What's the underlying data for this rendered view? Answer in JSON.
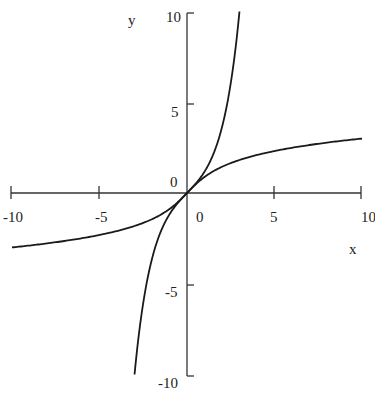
{
  "chart_data": {
    "type": "line",
    "title": "",
    "xlabel": "x",
    "ylabel": "y",
    "xlim": [
      -10,
      10
    ],
    "ylim": [
      -10,
      10
    ],
    "grid": false,
    "legend": null,
    "x_ticks": [
      -10,
      -5,
      0,
      5,
      10
    ],
    "y_ticks": [
      -10,
      -5,
      0,
      5,
      10
    ],
    "x_tick_labels": [
      "-10",
      "-5",
      "0",
      "5",
      "10"
    ],
    "y_tick_labels": [
      "-10",
      "-5",
      "0",
      "5",
      "10"
    ],
    "series": [
      {
        "name": "y = sinh(x)",
        "x": [
          -3.0,
          -2.5,
          -2,
          -1.5,
          -1,
          -0.5,
          0,
          0.5,
          1,
          1.5,
          2,
          2.5,
          3.0
        ],
        "values": [
          -10.02,
          -6.05,
          -3.63,
          -2.13,
          -1.18,
          -0.52,
          0,
          0.52,
          1.18,
          2.13,
          3.63,
          6.05,
          10.02
        ]
      },
      {
        "name": "y = arcsinh(x)",
        "x": [
          -10,
          -8,
          -6,
          -4,
          -2,
          -1,
          0,
          1,
          2,
          4,
          6,
          8,
          10
        ],
        "values": [
          -3.0,
          -2.78,
          -2.49,
          -2.09,
          -1.44,
          -0.88,
          0,
          0.88,
          1.44,
          2.09,
          2.49,
          2.78,
          3.0
        ]
      }
    ]
  },
  "labels": {
    "x_axis": "x",
    "y_axis": "y",
    "x_ticks": [
      "-10",
      "-5",
      "0",
      "5",
      "10"
    ],
    "y_ticks": [
      "10",
      "5",
      "0",
      "-5",
      "-10"
    ]
  }
}
